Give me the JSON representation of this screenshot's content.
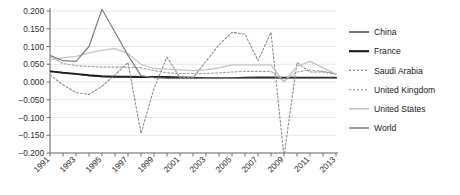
{
  "chart_data": {
    "type": "line",
    "title": "",
    "subtitle": "",
    "xlabel": "",
    "ylabel": "",
    "xlim": [
      1991,
      2013
    ],
    "ylim": [
      -0.2,
      0.2
    ],
    "grid": true,
    "legend_position": "right",
    "x": [
      1991,
      1992,
      1993,
      1994,
      1995,
      1996,
      1997,
      1998,
      1999,
      2000,
      2001,
      2002,
      2003,
      2004,
      2005,
      2006,
      2007,
      2008,
      2009,
      2010,
      2011,
      2012,
      2013
    ],
    "ytick_labels": [
      "0.200",
      "0.150",
      "0.100",
      "0.050",
      "0.000",
      "-0.050",
      "-0.100",
      "-0.150",
      "-0.200"
    ],
    "ytick_values": [
      0.2,
      0.15,
      0.1,
      0.05,
      0.0,
      -0.05,
      -0.1,
      -0.15,
      -0.2
    ],
    "xtick_labels": [
      "1991",
      "1993",
      "1995",
      "1997",
      "1999",
      "2001",
      "2003",
      "2005",
      "2007",
      "2009",
      "2011",
      "2013"
    ],
    "xtick_values": [
      1991,
      1993,
      1995,
      1997,
      1999,
      2001,
      2003,
      2005,
      2007,
      2009,
      2011,
      2013
    ],
    "series": [
      {
        "name": "China",
        "color": "#4a4a4a",
        "style": "solid",
        "width": 1.2,
        "values": [
          0.031,
          0.026,
          0.022,
          0.018,
          0.015,
          0.014,
          0.014,
          0.013,
          0.013,
          0.013,
          0.012,
          0.011,
          0.01,
          0.01,
          0.01,
          0.011,
          0.012,
          0.012,
          0.011,
          0.011,
          0.011,
          0.011,
          0.011
        ]
      },
      {
        "name": "France",
        "color": "#1f1f1f",
        "style": "solid",
        "width": 1.9,
        "values": [
          0.03,
          0.026,
          0.023,
          0.019,
          0.016,
          0.015,
          0.015,
          0.014,
          0.014,
          0.014,
          0.013,
          0.012,
          0.011,
          0.011,
          0.011,
          0.012,
          0.013,
          0.013,
          0.012,
          0.012,
          0.012,
          0.012,
          0.012
        ]
      },
      {
        "name": "Saudi Arabia",
        "color": "#8c8c8c",
        "style": "dashed",
        "width": 1.1,
        "values": [
          0.02,
          -0.008,
          -0.03,
          -0.035,
          -0.012,
          0.02,
          0.055,
          -0.145,
          -0.018,
          0.07,
          0.012,
          0.012,
          0.058,
          0.105,
          0.14,
          0.135,
          0.06,
          0.14,
          -0.21,
          0.055,
          0.028,
          0.028,
          0.022
        ]
      },
      {
        "name": "United Kingdom",
        "color": "#a0a0a0",
        "style": "dashed",
        "width": 1.1,
        "values": [
          0.072,
          0.052,
          0.046,
          0.044,
          0.042,
          0.042,
          0.042,
          0.04,
          0.032,
          0.026,
          0.024,
          0.024,
          0.024,
          0.026,
          0.028,
          0.03,
          0.03,
          0.03,
          0.002,
          0.028,
          0.034,
          0.03,
          0.024
        ]
      },
      {
        "name": "United States",
        "color": "#c4c4c4",
        "style": "solid",
        "width": 1.3,
        "values": [
          0.062,
          0.068,
          0.072,
          0.082,
          0.09,
          0.094,
          0.08,
          0.05,
          0.038,
          0.036,
          0.034,
          0.032,
          0.034,
          0.04,
          0.048,
          0.048,
          0.048,
          0.048,
          0.0,
          0.044,
          0.058,
          0.04,
          0.022
        ]
      },
      {
        "name": "World",
        "color": "#7d7d7d",
        "style": "solid",
        "width": 1.2,
        "values": [
          0.075,
          0.06,
          0.058,
          0.1,
          0.205,
          0.14,
          0.075,
          0.018,
          0.012,
          0.01,
          0.01,
          0.01,
          0.01,
          0.01,
          0.01,
          0.01,
          0.01,
          0.01,
          0.01,
          0.01,
          0.01,
          0.01,
          0.01
        ]
      }
    ]
  },
  "legend": {
    "items": [
      {
        "label": "China"
      },
      {
        "label": "France"
      },
      {
        "label": "Saudi Arabia"
      },
      {
        "label": "United Kingdom"
      },
      {
        "label": "United States"
      },
      {
        "label": "World"
      }
    ]
  },
  "axes": {
    "grid_color": "#e2e2e2",
    "axis_color": "#8a8a8a"
  }
}
